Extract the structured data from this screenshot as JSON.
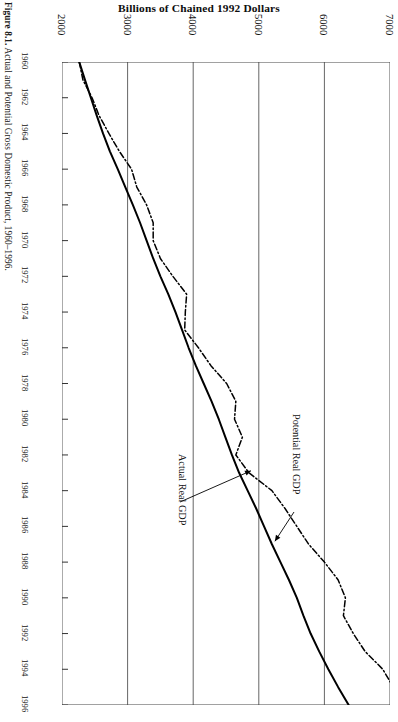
{
  "figure": {
    "label": "Figure 8.1.",
    "caption": "Actual and Potential Gross Domestic Product, 1960–1996."
  },
  "chart_data": {
    "type": "line",
    "title": "Billions of Chained 1992 Dollars",
    "orientation": "rotated-90",
    "xlabel": "",
    "ylabel": "Billions of Chained 1992 Dollars",
    "grid": true,
    "legend_position": "inline-annotations",
    "ylim": [
      2000,
      7000
    ],
    "xlim": [
      1960,
      1996
    ],
    "value_ticks": [
      2000,
      3000,
      4000,
      5000,
      6000,
      7000
    ],
    "year_ticks": [
      1960,
      1962,
      1964,
      1966,
      1968,
      1970,
      1972,
      1974,
      1976,
      1978,
      1980,
      1982,
      1984,
      1986,
      1988,
      1990,
      1992,
      1994,
      1996
    ],
    "x": [
      1960,
      1961,
      1962,
      1963,
      1964,
      1965,
      1966,
      1967,
      1968,
      1969,
      1970,
      1971,
      1972,
      1973,
      1974,
      1975,
      1976,
      1977,
      1978,
      1979,
      1980,
      1981,
      1982,
      1983,
      1984,
      1985,
      1986,
      1987,
      1988,
      1989,
      1990,
      1991,
      1992,
      1993,
      1994,
      1995,
      1996
    ],
    "series": [
      {
        "name": "Potential Real GDP",
        "style": "solid",
        "color": "#000000",
        "annotation": "Potential Real GDP",
        "values": [
          2263,
          2350,
          2440,
          2530,
          2625,
          2730,
          2850,
          2965,
          3080,
          3190,
          3290,
          3390,
          3500,
          3620,
          3730,
          3830,
          3930,
          4040,
          4160,
          4280,
          4390,
          4490,
          4590,
          4700,
          4830,
          4960,
          5080,
          5200,
          5330,
          5460,
          5580,
          5680,
          5790,
          5920,
          6060,
          6210,
          6370
        ]
      },
      {
        "name": "Actual Real GDP",
        "style": "dash-dot",
        "color": "#000000",
        "annotation": "Actual Real GDP",
        "values": [
          2263,
          2319,
          2458,
          2565,
          2715,
          2874,
          3060,
          3140,
          3290,
          3390,
          3390,
          3500,
          3690,
          3900,
          3880,
          3870,
          4080,
          4270,
          4510,
          4650,
          4630,
          4750,
          4650,
          4850,
          5200,
          5400,
          5580,
          5760,
          6000,
          6210,
          6320,
          6290,
          6440,
          6620,
          6890,
          7050,
          7280
        ]
      }
    ],
    "annotations": [
      {
        "text": "Actual Real GDP",
        "points_to_year": 1983
      },
      {
        "text": "Potential Real GDP",
        "points_to_year": 1987
      }
    ]
  }
}
